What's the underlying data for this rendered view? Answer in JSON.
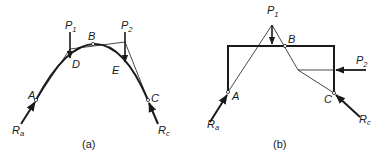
{
  "figure_a": {
    "caption": "(a)",
    "labels": {
      "P1_main": "P",
      "P1_sub": "1",
      "P2_main": "P",
      "P2_sub": "2",
      "A": "A",
      "B": "B",
      "C": "C",
      "D": "D",
      "E": "E",
      "Ra_main": "R",
      "Ra_sub": "a",
      "Rc_main": "R",
      "Rc_sub": "c"
    }
  },
  "figure_b": {
    "caption": "(b)",
    "labels": {
      "P1_main": "P",
      "P1_sub": "1",
      "P2_main": "P",
      "P2_sub": "2",
      "A": "A",
      "B": "B",
      "C": "C",
      "Ra_main": "R",
      "Ra_sub": "a",
      "Rc_main": "R",
      "Rc_sub": "c"
    }
  },
  "colors": {
    "ink": "#1a1a1a",
    "background": "#ffffff"
  }
}
